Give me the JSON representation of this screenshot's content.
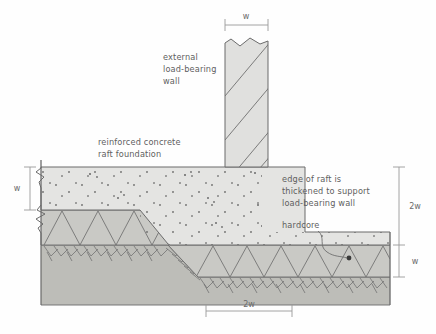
{
  "diagram": {
    "colors": {
      "concrete_fill": "#e4e4e2",
      "hardcore_fill": "#c9c9c5",
      "soil_fill": "#bdbdb8",
      "wall_fill": "#e0e0de",
      "line": "#5f5f5f",
      "text": "#5e5e5e",
      "dim_line": "#9a9a9a"
    },
    "annotations": [
      {
        "id": "wall-label",
        "lines": [
          "external",
          "load-bearing",
          "wall"
        ]
      },
      {
        "id": "raft-label",
        "lines": [
          "reinforced concrete",
          "raft foundation"
        ]
      },
      {
        "id": "edge-label",
        "lines": [
          "edge of raft is",
          "thickened to support",
          "load-bearing wall"
        ]
      },
      {
        "id": "hardcore-label",
        "lines": [
          "hardcore"
        ]
      }
    ],
    "dimensions": [
      {
        "id": "wall-width-top",
        "value": "w",
        "orientation": "horizontal",
        "position": "top"
      },
      {
        "id": "slab-thickness-left",
        "value": "w",
        "orientation": "vertical",
        "position": "left"
      },
      {
        "id": "raft-depth-right",
        "value": "2w",
        "orientation": "vertical",
        "position": "right-upper"
      },
      {
        "id": "hardcore-depth-right",
        "value": "w",
        "orientation": "vertical",
        "position": "right-lower"
      },
      {
        "id": "thickening-width",
        "value": "2w",
        "orientation": "horizontal",
        "position": "bottom"
      }
    ],
    "layers": [
      {
        "id": "wall",
        "name": "external load-bearing wall",
        "hatch": "diagonal"
      },
      {
        "id": "raft",
        "name": "reinforced concrete raft",
        "hatch": "stipple"
      },
      {
        "id": "hardcore",
        "name": "hardcore",
        "hatch": "triangles"
      },
      {
        "id": "soil",
        "name": "soil / subgrade",
        "hatch": "ticks"
      }
    ]
  }
}
